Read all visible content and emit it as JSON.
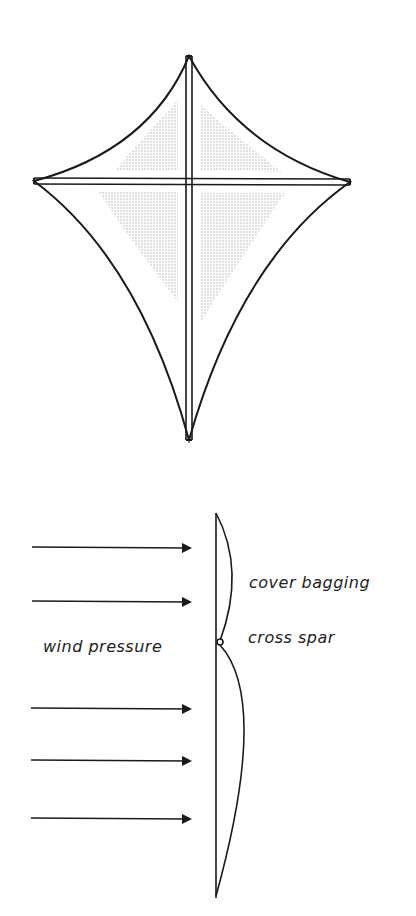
{
  "figure": {
    "top_view": {
      "name": "kite-front-view",
      "shading_color": "#c8c8c8",
      "line_color": "#1a1a1a"
    },
    "side_view": {
      "name": "kite-side-view-wind",
      "labels": {
        "cover_bagging": "cover bagging",
        "cross_spar": "cross spar",
        "wind_pressure": "wind pressure"
      },
      "arrow_count": 5
    }
  }
}
